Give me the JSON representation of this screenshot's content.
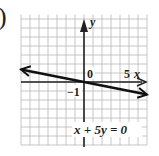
{
  "part_marker": ")",
  "chart_data": {
    "type": "line",
    "title": "",
    "equation": "x + 5y = 0",
    "xlabel": "x",
    "ylabel": "y",
    "tick_labels": {
      "origin": "0",
      "x_tick": "5",
      "y_tick": "−1"
    },
    "xlim": [
      -7,
      7
    ],
    "ylim": [
      -7,
      7.5
    ],
    "grid": true,
    "series": [
      {
        "name": "x + 5y = 0",
        "x": [
          -7,
          7
        ],
        "y": [
          1.4,
          -1.4
        ]
      }
    ]
  },
  "colors": {
    "grid": "#b8b8b8",
    "axis": "#222222",
    "line": "#111111"
  }
}
